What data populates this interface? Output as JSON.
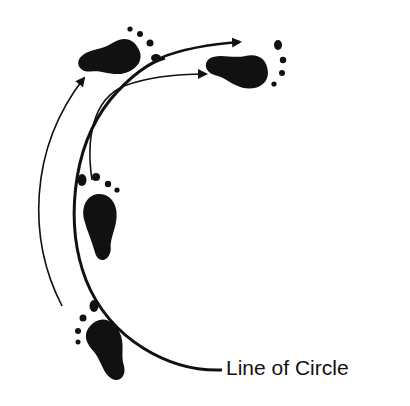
{
  "diagram": {
    "label": "Line of Circle",
    "colors": {
      "ink": "#111111",
      "background": "#ffffff"
    },
    "elements": [
      "footprint-bottom-left",
      "footprint-middle-left",
      "footprint-top-left",
      "footprint-top-right",
      "line-of-circle-arc",
      "arrow-outer-left",
      "arrow-from-middle-foot",
      "arrow-top-curve"
    ]
  }
}
